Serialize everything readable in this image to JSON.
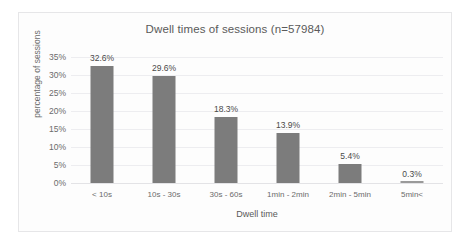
{
  "chart_data": {
    "type": "bar",
    "title": "Dwell times of sessions (n=57984)",
    "xlabel": "Dwell time",
    "ylabel": "percentage of sessions",
    "categories": [
      "< 10s",
      "10s - 30s",
      "30s - 60s",
      "1min - 2min",
      "2min - 5min",
      "5min<"
    ],
    "values": [
      32.6,
      29.6,
      18.3,
      13.9,
      5.4,
      0.3
    ],
    "value_labels": [
      "32.6%",
      "29.6%",
      "18.3%",
      "13.9%",
      "5.4%",
      "0.3%"
    ],
    "ylim": [
      0,
      35
    ],
    "ytick_labels": [
      "35%",
      "30%",
      "25%",
      "20%",
      "15%",
      "10%",
      "5%",
      "0%"
    ],
    "ytick_values": [
      35,
      30,
      25,
      20,
      15,
      10,
      5,
      0
    ],
    "grid": true,
    "legend": "none",
    "series_color": "#7c7c7c",
    "background_color": "#fdfdfd",
    "text_color": "#5a5a5a"
  }
}
